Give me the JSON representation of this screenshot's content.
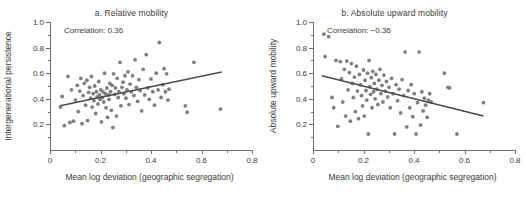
{
  "figure": {
    "background": "#ffffff",
    "point_color": "#7f7f7f",
    "line_color": "#4a4a4a",
    "axis_color": "#6e6e6e"
  },
  "chart_data": [
    {
      "type": "scatter",
      "panel": "a",
      "title": "a. Relative mobility",
      "annotation": "Correlation: 0.36",
      "correlation": 0.36,
      "xlabel": "Mean log deviation (geographic segregation)",
      "ylabel": "Intergenerational persistence",
      "xlim": [
        0,
        0.8
      ],
      "ylim": [
        0,
        1.0
      ],
      "xticks": [
        0,
        0.2,
        0.4,
        0.6,
        0.8
      ],
      "xticklabels": [
        "0",
        "0.2",
        "0.4",
        "0.6",
        "0.8"
      ],
      "yticks": [
        0.2,
        0.4,
        0.6,
        0.8,
        1.0
      ],
      "yticklabels": [
        "0.2",
        "0.4",
        "0.6",
        "0.8",
        "1.0"
      ],
      "grid": false,
      "legend": "none",
      "fit_line": {
        "x": [
          0.04,
          0.68
        ],
        "y": [
          0.345,
          0.61
        ]
      },
      "points": [
        [
          0.041,
          0.335
        ],
        [
          0.048,
          0.418
        ],
        [
          0.057,
          0.19
        ],
        [
          0.071,
          0.575
        ],
        [
          0.079,
          0.215
        ],
        [
          0.085,
          0.47
        ],
        [
          0.093,
          0.225
        ],
        [
          0.101,
          0.39
        ],
        [
          0.108,
          0.505
        ],
        [
          0.112,
          0.3
        ],
        [
          0.118,
          0.46
        ],
        [
          0.122,
          0.56
        ],
        [
          0.127,
          0.205
        ],
        [
          0.131,
          0.425
        ],
        [
          0.136,
          0.52
        ],
        [
          0.141,
          0.35
        ],
        [
          0.146,
          0.545
        ],
        [
          0.149,
          0.23
        ],
        [
          0.153,
          0.45
        ],
        [
          0.157,
          0.49
        ],
        [
          0.161,
          0.405
        ],
        [
          0.164,
          0.575
        ],
        [
          0.167,
          0.335
        ],
        [
          0.171,
          0.44
        ],
        [
          0.174,
          0.385
        ],
        [
          0.177,
          0.5
        ],
        [
          0.181,
          0.285
        ],
        [
          0.184,
          0.455
        ],
        [
          0.187,
          0.415
        ],
        [
          0.19,
          0.36
        ],
        [
          0.193,
          0.535
        ],
        [
          0.196,
          0.43
        ],
        [
          0.198,
          0.395
        ],
        [
          0.201,
          0.47
        ],
        [
          0.204,
          0.22
        ],
        [
          0.207,
          0.41
        ],
        [
          0.21,
          0.455
        ],
        [
          0.213,
          0.375
        ],
        [
          0.216,
          0.6
        ],
        [
          0.219,
          0.44
        ],
        [
          0.222,
          0.33
        ],
        [
          0.225,
          0.485
        ],
        [
          0.228,
          0.255
        ],
        [
          0.231,
          0.43
        ],
        [
          0.234,
          0.395
        ],
        [
          0.237,
          0.52
        ],
        [
          0.24,
          0.455
        ],
        [
          0.243,
          0.31
        ],
        [
          0.246,
          0.505
        ],
        [
          0.249,
          0.175
        ],
        [
          0.252,
          0.595
        ],
        [
          0.256,
          0.435
        ],
        [
          0.259,
          0.485
        ],
        [
          0.263,
          0.265
        ],
        [
          0.266,
          0.56
        ],
        [
          0.27,
          0.41
        ],
        [
          0.273,
          0.455
        ],
        [
          0.277,
          0.685
        ],
        [
          0.281,
          0.345
        ],
        [
          0.285,
          0.49
        ],
        [
          0.289,
          0.53
        ],
        [
          0.293,
          0.44
        ],
        [
          0.297,
          0.58
        ],
        [
          0.301,
          0.405
        ],
        [
          0.305,
          0.47
        ],
        [
          0.309,
          0.61
        ],
        [
          0.313,
          0.355
        ],
        [
          0.317,
          0.515
        ],
        [
          0.322,
          0.455
        ],
        [
          0.327,
          0.58
        ],
        [
          0.332,
          0.425
        ],
        [
          0.337,
          0.705
        ],
        [
          0.342,
          0.49
        ],
        [
          0.347,
          0.38
        ],
        [
          0.352,
          0.55
        ],
        [
          0.357,
          0.465
        ],
        [
          0.363,
          0.305
        ],
        [
          0.369,
          0.63
        ],
        [
          0.375,
          0.43
        ],
        [
          0.381,
          0.745
        ],
        [
          0.387,
          0.485
        ],
        [
          0.393,
          0.395
        ],
        [
          0.4,
          0.555
        ],
        [
          0.407,
          0.455
        ],
        [
          0.414,
          0.35
        ],
        [
          0.421,
          0.6
        ],
        [
          0.428,
          0.47
        ],
        [
          0.433,
          0.84
        ],
        [
          0.44,
          0.41
        ],
        [
          0.447,
          0.51
        ],
        [
          0.452,
          0.635
        ],
        [
          0.457,
          0.455
        ],
        [
          0.462,
          0.595
        ],
        [
          0.467,
          0.39
        ],
        [
          0.471,
          0.475
        ],
        [
          0.536,
          0.345
        ],
        [
          0.543,
          0.295
        ],
        [
          0.57,
          0.685
        ],
        [
          0.675,
          0.32
        ]
      ]
    },
    {
      "type": "scatter",
      "panel": "b",
      "title": "b. Absolute upward mobility",
      "annotation": "Correlation: −0.36",
      "correlation": -0.36,
      "xlabel": "Mean log deviation (geographic segregation)",
      "ylabel": "Absolute upward mobility",
      "xlim": [
        0,
        0.8
      ],
      "ylim": [
        0,
        1.0
      ],
      "xticks": [
        0,
        0.2,
        0.4,
        0.6,
        0.8
      ],
      "xticklabels": [
        "0",
        "0.2",
        "0.4",
        "0.6",
        "0.8"
      ],
      "yticks": [
        0.2,
        0.4,
        0.6,
        0.8,
        1.0
      ],
      "yticklabels": [
        "0.2",
        "0.4",
        "0.6",
        "0.8",
        "1.0"
      ],
      "grid": false,
      "legend": "none",
      "fit_line": {
        "x": [
          0.035,
          0.675
        ],
        "y": [
          0.58,
          0.265
        ]
      },
      "points": [
        [
          0.043,
          0.905
        ],
        [
          0.048,
          0.73
        ],
        [
          0.062,
          0.885
        ],
        [
          0.075,
          0.41
        ],
        [
          0.082,
          0.33
        ],
        [
          0.091,
          0.7
        ],
        [
          0.098,
          0.185
        ],
        [
          0.108,
          0.69
        ],
        [
          0.113,
          0.555
        ],
        [
          0.118,
          0.375
        ],
        [
          0.124,
          0.63
        ],
        [
          0.129,
          0.265
        ],
        [
          0.134,
          0.695
        ],
        [
          0.139,
          0.47
        ],
        [
          0.144,
          0.605
        ],
        [
          0.148,
          0.225
        ],
        [
          0.152,
          0.675
        ],
        [
          0.156,
          0.52
        ],
        [
          0.16,
          0.41
        ],
        [
          0.164,
          0.57
        ],
        [
          0.168,
          0.3
        ],
        [
          0.172,
          0.655
        ],
        [
          0.176,
          0.46
        ],
        [
          0.18,
          0.245
        ],
        [
          0.184,
          0.59
        ],
        [
          0.188,
          0.51
        ],
        [
          0.192,
          0.425
        ],
        [
          0.196,
          0.345
        ],
        [
          0.2,
          0.625
        ],
        [
          0.203,
          0.265
        ],
        [
          0.206,
          0.545
        ],
        [
          0.21,
          0.465
        ],
        [
          0.213,
          0.39
        ],
        [
          0.216,
          0.6
        ],
        [
          0.219,
          0.125
        ],
        [
          0.222,
          0.7
        ],
        [
          0.225,
          0.495
        ],
        [
          0.228,
          0.435
        ],
        [
          0.231,
          0.565
        ],
        [
          0.234,
          0.33
        ],
        [
          0.237,
          0.615
        ],
        [
          0.24,
          0.455
        ],
        [
          0.243,
          0.52
        ],
        [
          0.246,
          0.4
        ],
        [
          0.249,
          0.59
        ],
        [
          0.253,
          0.475
        ],
        [
          0.257,
          0.355
        ],
        [
          0.261,
          0.545
        ],
        [
          0.265,
          0.63
        ],
        [
          0.269,
          0.44
        ],
        [
          0.273,
          0.505
        ],
        [
          0.277,
          0.375
        ],
        [
          0.281,
          0.585
        ],
        [
          0.286,
          0.46
        ],
        [
          0.291,
          0.535
        ],
        [
          0.296,
          0.415
        ],
        [
          0.301,
          0.49
        ],
        [
          0.306,
          0.33
        ],
        [
          0.311,
          0.56
        ],
        [
          0.317,
          0.44
        ],
        [
          0.323,
          0.125
        ],
        [
          0.329,
          0.51
        ],
        [
          0.335,
          0.385
        ],
        [
          0.341,
          0.475
        ],
        [
          0.347,
          0.29
        ],
        [
          0.353,
          0.55
        ],
        [
          0.359,
          0.425
        ],
        [
          0.365,
          0.765
        ],
        [
          0.371,
          0.18
        ],
        [
          0.377,
          0.465
        ],
        [
          0.383,
          0.33
        ],
        [
          0.389,
          0.51
        ],
        [
          0.395,
          0.26
        ],
        [
          0.401,
          0.44
        ],
        [
          0.408,
          0.125
        ],
        [
          0.414,
          0.37
        ],
        [
          0.42,
          0.765
        ],
        [
          0.426,
          0.195
        ],
        [
          0.431,
          0.455
        ],
        [
          0.436,
          0.305
        ],
        [
          0.441,
          0.405
        ],
        [
          0.446,
          0.35
        ],
        [
          0.452,
          0.255
        ],
        [
          0.457,
          0.39
        ],
        [
          0.462,
          0.44
        ],
        [
          0.468,
          0.375
        ],
        [
          0.52,
          0.6
        ],
        [
          0.535,
          0.49
        ],
        [
          0.541,
          0.485
        ],
        [
          0.57,
          0.125
        ],
        [
          0.675,
          0.37
        ]
      ]
    }
  ]
}
